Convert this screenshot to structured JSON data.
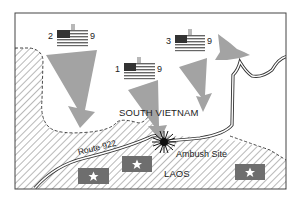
{
  "map": {
    "regions": [
      {
        "label": "SOUTH VIETNAM",
        "pattern": "plain"
      },
      {
        "label": "LAOS",
        "pattern": "hatched"
      }
    ],
    "route": {
      "label": "Route 922"
    },
    "ambush": {
      "label": "Ambush Site",
      "icon": "explosion-starburst-icon"
    },
    "us_units": [
      {
        "number": "1",
        "size": "II",
        "designation": "9",
        "icon": "us-flag-icon"
      },
      {
        "number": "2",
        "size": "II",
        "designation": "9",
        "icon": "us-flag-icon"
      },
      {
        "number": "3",
        "size": "II",
        "designation": "9",
        "icon": "us-flag-icon"
      }
    ],
    "enemy_units": [
      {
        "icon": "star-flag-icon"
      },
      {
        "icon": "star-flag-icon"
      },
      {
        "icon": "star-flag-icon"
      }
    ],
    "colors": {
      "arrow": "#a3a3a3",
      "enemy_flag": "#6e6e6e",
      "hatch": "#9a9a9a",
      "border": "#333333",
      "flag_canton": "#333333",
      "flag_stripe": "#555555"
    }
  }
}
